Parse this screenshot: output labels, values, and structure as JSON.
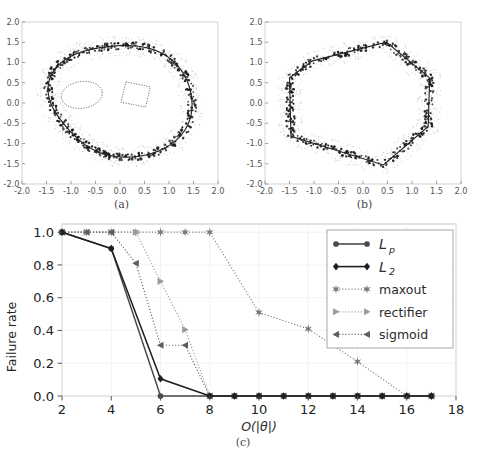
{
  "figure": {
    "panels": [
      {
        "id": "a",
        "caption": "(a)"
      },
      {
        "id": "b",
        "caption": "(b)"
      },
      {
        "id": "c",
        "caption": "(c)"
      }
    ]
  },
  "scatter_a": {
    "caption": "(a)",
    "xlim": [
      -2.0,
      2.0
    ],
    "ylim": [
      -2.0,
      2.0
    ],
    "xticks": [
      "-2.0",
      "-1.5",
      "-1.0",
      "-0.5",
      "0.0",
      "0.5",
      "1.0",
      "1.5",
      "2.0"
    ],
    "yticks": [
      "-2.0",
      "-1.5",
      "-1.0",
      "-0.5",
      "0.0",
      "0.5",
      "1.0",
      "1.5",
      "2.0"
    ],
    "boundary_style": "smooth-closed-blob",
    "inner_contours": [
      "ellipse",
      "rounded-quadrilateral"
    ],
    "noise_color": "#b8b8b8",
    "point_color": "#1a1a1a",
    "curve_color": "#222222"
  },
  "scatter_b": {
    "caption": "(b)",
    "xlim": [
      -2.0,
      2.0
    ],
    "ylim": [
      -2.0,
      2.0
    ],
    "xticks": [
      "-2.0",
      "-1.5",
      "-1.0",
      "-0.5",
      "0.0",
      "0.5",
      "1.0",
      "1.5",
      "2.0"
    ],
    "yticks": [
      "-2.0",
      "-1.5",
      "-1.0",
      "-0.5",
      "0.0",
      "0.5",
      "1.0",
      "1.5",
      "2.0"
    ],
    "boundary_style": "polygonal-hexagon",
    "inner_contours": [],
    "noise_color": "#b8b8b8",
    "point_color": "#1a1a1a",
    "curve_color": "#222222"
  },
  "chart_data": {
    "type": "line",
    "title": "",
    "caption": "(c)",
    "xlabel": "O(|θ|)",
    "ylabel": "Failure rate",
    "xlim": [
      2,
      18
    ],
    "ylim": [
      0.0,
      1.05
    ],
    "xticks": [
      2,
      4,
      6,
      8,
      10,
      12,
      14,
      16,
      18
    ],
    "xticklabels": [
      "2",
      "4",
      "6",
      "8",
      "10",
      "12",
      "14",
      "16",
      "18"
    ],
    "yticks": [
      0.0,
      0.2,
      0.4,
      0.6,
      0.8,
      1.0
    ],
    "yticklabels": [
      "0.0",
      "0.2",
      "0.4",
      "0.6",
      "0.8",
      "1.0"
    ],
    "grid": true,
    "legend_position": "upper right",
    "series": [
      {
        "name": "L_p",
        "label": "L",
        "sub": "p",
        "marker": "circle",
        "linestyle": "solid",
        "color": "#4a4a4a",
        "x": [
          2,
          4,
          6,
          8,
          9,
          10,
          11,
          12,
          13,
          14,
          15,
          16,
          17
        ],
        "values": [
          1.0,
          0.9,
          0.0,
          0.0,
          0.0,
          0.0,
          0.0,
          0.0,
          0.0,
          0.0,
          0.0,
          0.0,
          0.0
        ]
      },
      {
        "name": "L_2",
        "label": "L",
        "sub": "2",
        "marker": "diamond",
        "linestyle": "solid",
        "color": "#1f1f1f",
        "x": [
          2,
          4,
          6,
          8,
          9,
          10,
          11,
          12,
          13,
          14,
          15,
          16,
          17
        ],
        "values": [
          1.0,
          0.9,
          0.105,
          0.0,
          0.0,
          0.0,
          0.0,
          0.0,
          0.0,
          0.0,
          0.0,
          0.0,
          0.0
        ]
      },
      {
        "name": "maxout",
        "label": "maxout",
        "marker": "star",
        "linestyle": "dotted",
        "color": "#787878",
        "x": [
          2,
          3,
          4,
          5,
          6,
          7,
          8,
          10,
          12,
          14,
          16,
          17
        ],
        "values": [
          1.0,
          1.0,
          1.0,
          1.0,
          1.0,
          1.0,
          1.0,
          0.51,
          0.41,
          0.21,
          0.0,
          0.0
        ]
      },
      {
        "name": "rectifier",
        "label": "rectifier",
        "marker": "triangle-right",
        "linestyle": "dotted",
        "color": "#9a9a9a",
        "x": [
          2,
          3,
          4,
          5,
          6,
          7,
          8,
          9,
          10,
          11,
          12,
          13,
          14,
          15,
          16,
          17
        ],
        "values": [
          1.0,
          1.0,
          1.0,
          1.0,
          0.7,
          0.405,
          0.0,
          0.0,
          0.0,
          0.0,
          0.0,
          0.0,
          0.0,
          0.0,
          0.0,
          0.0
        ]
      },
      {
        "name": "sigmoid",
        "label": "sigmoid",
        "marker": "triangle-left",
        "linestyle": "dotted",
        "color": "#5e5e5e",
        "x": [
          2,
          3,
          4,
          5,
          6,
          7,
          8,
          9,
          10,
          11,
          12,
          13,
          14,
          15,
          16,
          17
        ],
        "values": [
          1.0,
          1.0,
          1.0,
          0.81,
          0.31,
          0.31,
          0.0,
          0.0,
          0.0,
          0.0,
          0.0,
          0.0,
          0.0,
          0.0,
          0.0,
          0.0
        ]
      }
    ]
  }
}
